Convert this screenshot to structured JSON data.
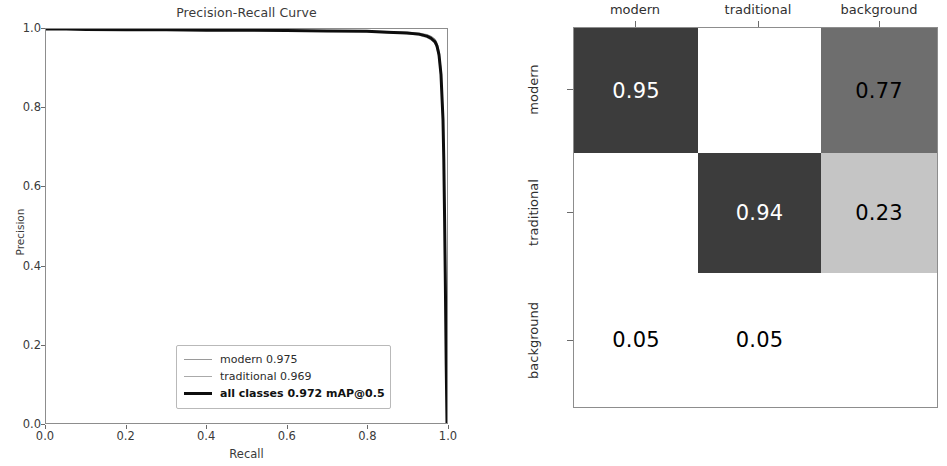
{
  "pr_chart": {
    "title": "Precision-Recall Curve",
    "xlabel": "Recall",
    "ylabel": "Precision",
    "xticks": [
      "0.0",
      "0.2",
      "0.4",
      "0.6",
      "0.8",
      "1.0"
    ],
    "yticks": [
      "0.0",
      "0.2",
      "0.4",
      "0.6",
      "0.8",
      "1.0"
    ],
    "legend": [
      {
        "label": "modern 0.975",
        "style": "thin",
        "color": "#9a9a9a"
      },
      {
        "label": "traditional 0.969",
        "style": "thin",
        "color": "#aaaaaa"
      },
      {
        "label": "all classes 0.972 mAP@0.5",
        "style": "thick",
        "color": "#0d0d0d"
      }
    ]
  },
  "confusion_matrix": {
    "col_headers": [
      "modern",
      "traditional",
      "background"
    ],
    "row_headers": [
      "modern",
      "traditional",
      "background"
    ],
    "cells": [
      {
        "value": "0.95",
        "bg": "#3c3c3c",
        "fg": "#ffffff"
      },
      {
        "value": "",
        "bg": "#ffffff",
        "fg": "#000000"
      },
      {
        "value": "0.77",
        "bg": "#6e6e6e",
        "fg": "#000000"
      },
      {
        "value": "",
        "bg": "#ffffff",
        "fg": "#000000"
      },
      {
        "value": "0.94",
        "bg": "#3c3c3c",
        "fg": "#ffffff"
      },
      {
        "value": "0.23",
        "bg": "#c5c5c5",
        "fg": "#000000"
      },
      {
        "value": "0.05",
        "bg": "#ffffff",
        "fg": "#000000"
      },
      {
        "value": "0.05",
        "bg": "#ffffff",
        "fg": "#000000"
      },
      {
        "value": "",
        "bg": "#ffffff",
        "fg": "#000000"
      }
    ]
  },
  "chart_data": [
    {
      "type": "line",
      "title": "Precision-Recall Curve",
      "xlabel": "Recall",
      "ylabel": "Precision",
      "xlim": [
        0.0,
        1.0
      ],
      "ylim": [
        0.0,
        1.0
      ],
      "grid": false,
      "legend_position": "lower center",
      "series": [
        {
          "name": "modern 0.975",
          "ap": 0.975,
          "color": "#9a9a9a",
          "linewidth": 1,
          "x": [
            0.0,
            0.05,
            0.1,
            0.2,
            0.3,
            0.4,
            0.5,
            0.6,
            0.7,
            0.8,
            0.85,
            0.9,
            0.93,
            0.95,
            0.96,
            0.97,
            0.975,
            0.98,
            0.985,
            0.99,
            0.992,
            0.994,
            0.996,
            0.998,
            1.0
          ],
          "y": [
            1.0,
            1.0,
            0.999,
            0.999,
            0.998,
            0.998,
            0.997,
            0.997,
            0.996,
            0.995,
            0.994,
            0.992,
            0.99,
            0.986,
            0.982,
            0.975,
            0.965,
            0.945,
            0.9,
            0.79,
            0.69,
            0.54,
            0.36,
            0.16,
            0.0
          ]
        },
        {
          "name": "traditional 0.969",
          "ap": 0.969,
          "color": "#aaaaaa",
          "linewidth": 1,
          "x": [
            0.0,
            0.05,
            0.1,
            0.2,
            0.3,
            0.4,
            0.5,
            0.6,
            0.7,
            0.8,
            0.85,
            0.9,
            0.93,
            0.95,
            0.96,
            0.97,
            0.975,
            0.98,
            0.985,
            0.99,
            0.992,
            0.994,
            0.996,
            0.998,
            1.0
          ],
          "y": [
            1.0,
            0.999,
            0.999,
            0.998,
            0.997,
            0.997,
            0.996,
            0.995,
            0.994,
            0.993,
            0.991,
            0.988,
            0.984,
            0.978,
            0.972,
            0.962,
            0.95,
            0.925,
            0.87,
            0.75,
            0.65,
            0.5,
            0.33,
            0.14,
            0.0
          ]
        },
        {
          "name": "all classes 0.972 mAP@0.5",
          "ap": 0.972,
          "color": "#0d0d0d",
          "linewidth": 3,
          "x": [
            0.0,
            0.05,
            0.1,
            0.2,
            0.3,
            0.4,
            0.5,
            0.6,
            0.7,
            0.8,
            0.85,
            0.9,
            0.93,
            0.95,
            0.96,
            0.97,
            0.975,
            0.98,
            0.985,
            0.99,
            0.992,
            0.994,
            0.996,
            0.998,
            1.0
          ],
          "y": [
            1.0,
            1.0,
            0.999,
            0.998,
            0.998,
            0.997,
            0.997,
            0.996,
            0.995,
            0.994,
            0.992,
            0.99,
            0.987,
            0.982,
            0.977,
            0.968,
            0.957,
            0.935,
            0.885,
            0.77,
            0.67,
            0.52,
            0.345,
            0.15,
            0.0
          ]
        }
      ]
    },
    {
      "type": "heatmap",
      "title": "",
      "xlabel": "",
      "ylabel": "",
      "x_categories": [
        "modern",
        "traditional",
        "background"
      ],
      "y_categories": [
        "modern",
        "traditional",
        "background"
      ],
      "values": [
        [
          0.95,
          null,
          0.77
        ],
        [
          null,
          0.94,
          0.23
        ],
        [
          0.05,
          0.05,
          null
        ]
      ],
      "colormap": "grayscale_inverted",
      "vmin": 0.0,
      "vmax": 1.0
    }
  ]
}
